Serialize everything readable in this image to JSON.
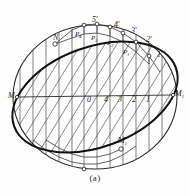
{
  "figure": {
    "caption": "(a)",
    "colors": {
      "ink": "#1a1a1a",
      "thin_line": "#4a4a4a",
      "hatch": "#555555",
      "background": "#fefefe"
    },
    "axis_ticks": [
      {
        "label": "0",
        "x": 87,
        "y": 101
      },
      {
        "label": "4",
        "x": 104,
        "y": 101
      },
      {
        "label": "3",
        "x": 118,
        "y": 101
      },
      {
        "label": "2",
        "x": 133,
        "y": 101
      },
      {
        "label": "1",
        "x": 146,
        "y": 101
      }
    ],
    "primed_points": [
      {
        "label": "5'",
        "x": 92,
        "y": 16
      },
      {
        "label": "4'",
        "x": 114,
        "y": 21
      },
      {
        "label": "3'",
        "x": 131,
        "y": 27
      },
      {
        "label": "2'",
        "x": 146,
        "y": 36
      },
      {
        "label": "1'",
        "x": 157,
        "y": 51
      }
    ],
    "p_points": [
      {
        "base": "P",
        "sub": "4",
        "x": 79,
        "y": 32
      },
      {
        "base": "P",
        "sub": "3",
        "x": 95,
        "y": 36
      },
      {
        "base": "P",
        "sub": "2",
        "x": 111,
        "y": 41
      },
      {
        "base": "P",
        "sub": "1",
        "x": 127,
        "y": 50
      }
    ],
    "endpoints": [
      {
        "base": "M",
        "sub": "",
        "prime": "",
        "x": 12,
        "y": 97
      },
      {
        "base": "M",
        "sub": "1",
        "prime": "",
        "x": 170,
        "y": 95
      },
      {
        "base": "N",
        "sub": "",
        "prime": "",
        "x": 57,
        "y": 39
      },
      {
        "base": "M",
        "sub": "1",
        "prime": "'",
        "x": 121,
        "y": 142
      }
    ]
  }
}
